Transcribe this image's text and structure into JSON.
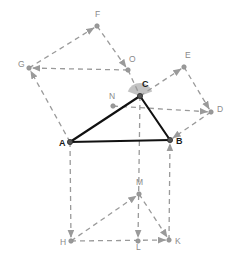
{
  "figure": {
    "canvas": {
      "width": 236,
      "height": 267,
      "background": "#ffffff"
    },
    "colors": {
      "solid_stroke": "#111111",
      "dashed_stroke": "#9a9a9a",
      "vertex_fill": "#555555",
      "aux_vertex_fill": "#9a9a9a",
      "angle_sector_fill": "#b8b8b8",
      "label_main": "#1a1a1a",
      "label_aux": "#8a8a8a"
    },
    "points": {
      "A": {
        "label": "A",
        "x": 70,
        "y": 142,
        "style": "main"
      },
      "B": {
        "label": "B",
        "x": 170,
        "y": 140,
        "style": "main"
      },
      "C": {
        "label": "C",
        "x": 140,
        "y": 96,
        "style": "main"
      },
      "D": {
        "label": "D",
        "x": 211,
        "y": 112,
        "style": "aux"
      },
      "E": {
        "label": "E",
        "x": 184,
        "y": 67,
        "style": "aux"
      },
      "F": {
        "label": "F",
        "x": 97,
        "y": 26,
        "style": "aux"
      },
      "G": {
        "label": "G",
        "x": 29,
        "y": 68,
        "style": "aux"
      },
      "H": {
        "label": "H",
        "x": 71,
        "y": 241,
        "style": "aux"
      },
      "K": {
        "label": "K",
        "x": 169,
        "y": 240,
        "style": "aux"
      },
      "L": {
        "label": "L",
        "x": 138,
        "y": 241,
        "style": "aux"
      },
      "M": {
        "label": "M",
        "x": 139,
        "y": 194,
        "style": "aux"
      },
      "N": {
        "label": "N",
        "x": 113,
        "y": 106,
        "style": "aux"
      },
      "O": {
        "label": "O",
        "x": 128,
        "y": 70,
        "style": "aux"
      }
    },
    "label_offsets": {
      "A": {
        "dx": -11,
        "dy": 1
      },
      "B": {
        "dx": 6,
        "dy": 1
      },
      "C": {
        "dx": 2,
        "dy": -12
      },
      "D": {
        "dx": 6,
        "dy": -3
      },
      "E": {
        "dx": 1,
        "dy": -12
      },
      "F": {
        "dx": -2,
        "dy": -12
      },
      "G": {
        "dx": -11,
        "dy": -4
      },
      "H": {
        "dx": -11,
        "dy": 1
      },
      "K": {
        "dx": 6,
        "dy": 1
      },
      "L": {
        "dx": -2,
        "dy": 6
      },
      "M": {
        "dx": -3,
        "dy": -12
      },
      "N": {
        "dx": -4,
        "dy": -10
      },
      "O": {
        "dx": 1,
        "dy": -11
      }
    },
    "solid_edges": [
      {
        "name": "side-AB",
        "from": "A",
        "to": "B"
      },
      {
        "name": "side-AC",
        "from": "A",
        "to": "C"
      },
      {
        "name": "side-CB",
        "from": "C",
        "to": "B"
      }
    ],
    "dashed_edges": [
      {
        "name": "square-AC-edge-A-G",
        "from": "A",
        "to": "G",
        "arrow": true
      },
      {
        "name": "square-AC-edge-G-F",
        "from": "G",
        "to": "F",
        "arrow": true
      },
      {
        "name": "square-AC-edge-F-O",
        "from": "F",
        "to": "O",
        "arrow": true
      },
      {
        "name": "square-AC-edge-O-C",
        "from": "O",
        "to": "C",
        "arrow": false
      },
      {
        "name": "square-AC-diagonal-O-G",
        "from": "O",
        "to": "G",
        "arrow": true
      },
      {
        "name": "square-CB-edge-C-E",
        "from": "C",
        "to": "E",
        "arrow": true
      },
      {
        "name": "square-CB-edge-E-D",
        "from": "E",
        "to": "D",
        "arrow": true
      },
      {
        "name": "square-CB-edge-D-B",
        "from": "D",
        "to": "B",
        "arrow": true
      },
      {
        "name": "square-AB-edge-A-H",
        "from": "A",
        "to": "H",
        "arrow": true
      },
      {
        "name": "square-AB-edge-H-K",
        "from": "H",
        "to": "K",
        "arrow": true
      },
      {
        "name": "square-AB-edge-K-B",
        "from": "K",
        "to": "B",
        "arrow": true
      },
      {
        "name": "median-H-M",
        "from": "H",
        "to": "M",
        "arrow": true
      },
      {
        "name": "median-M-K",
        "from": "M",
        "to": "K",
        "arrow": true
      },
      {
        "name": "altitude-C-L",
        "from": "C",
        "to": "L",
        "arrow": true
      },
      {
        "name": "parallel-N-D",
        "from": "N",
        "to": "D",
        "arrow": true
      }
    ],
    "angle_marker": {
      "name": "angle-at-C",
      "vertex": "C",
      "radius": 13,
      "start_deg": 200,
      "end_deg": 340
    }
  }
}
